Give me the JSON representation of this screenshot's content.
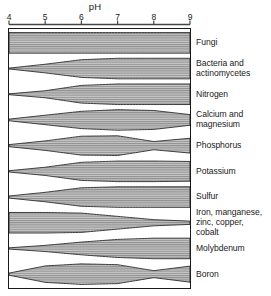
{
  "chart_data": {
    "type": "area",
    "xlabel": "pH",
    "ylabel": "",
    "xlim": [
      4,
      9
    ],
    "xticks": [
      4,
      5,
      6,
      7,
      8,
      9
    ],
    "xtick_labels": [
      "4",
      "5",
      "6",
      "7",
      "8",
      "9"
    ],
    "grid": false,
    "legend_position": "right",
    "note": "Band thickness at each pH indicates relative availability / activity. Values below are band half-widths in chart units (0-1) sampled at pH 4,5,6,7,8,9.",
    "categories": [
      "Fungi",
      "Bacteria and actinomycetes",
      "Nitrogen",
      "Calcium and magnesium",
      "Phosphorus",
      "Potassium",
      "Sulfur",
      "Iron, manganese, zinc, copper, cobalt",
      "Molybdenum",
      "Boron"
    ],
    "series": [
      {
        "name": "Fungi",
        "x": [
          4,
          5,
          6,
          7,
          8,
          9
        ],
        "values": [
          1.0,
          1.0,
          1.0,
          1.0,
          1.0,
          1.0
        ]
      },
      {
        "name": "Bacteria and actinomycetes",
        "x": [
          4,
          5,
          6,
          7,
          8,
          9
        ],
        "values": [
          0.04,
          0.42,
          0.86,
          1.0,
          1.0,
          1.0
        ]
      },
      {
        "name": "Nitrogen",
        "x": [
          4,
          5,
          6,
          7,
          8,
          9
        ],
        "values": [
          0.04,
          0.34,
          0.86,
          1.0,
          1.0,
          1.0
        ]
      },
      {
        "name": "Calcium and magnesium",
        "x": [
          4,
          5,
          6,
          7,
          8,
          9
        ],
        "values": [
          0.08,
          0.46,
          0.84,
          1.0,
          0.92,
          0.52
        ]
      },
      {
        "name": "Phosphorus",
        "x": [
          4,
          5,
          6,
          7,
          8,
          9
        ],
        "values": [
          0.1,
          0.46,
          0.92,
          0.96,
          0.4,
          0.72
        ]
      },
      {
        "name": "Potassium",
        "x": [
          4,
          5,
          6,
          7,
          8,
          9
        ],
        "values": [
          0.06,
          0.4,
          0.88,
          1.0,
          1.0,
          0.96
        ]
      },
      {
        "name": "Sulfur",
        "x": [
          4,
          5,
          6,
          7,
          8,
          9
        ],
        "values": [
          0.1,
          0.46,
          0.9,
          1.0,
          1.0,
          1.0
        ]
      },
      {
        "name": "Iron, manganese, zinc, copper, cobalt",
        "x": [
          4,
          5,
          6,
          7,
          8,
          9
        ],
        "values": [
          1.0,
          1.0,
          0.94,
          0.62,
          0.3,
          0.16
        ]
      },
      {
        "name": "Molybdenum",
        "x": [
          4,
          5,
          6,
          7,
          8,
          9
        ],
        "values": [
          0.06,
          0.3,
          0.62,
          0.88,
          1.0,
          1.0
        ]
      },
      {
        "name": "Boron",
        "x": [
          4,
          5,
          6,
          7,
          8,
          9
        ],
        "values": [
          0.1,
          0.8,
          1.0,
          0.92,
          0.34,
          0.78
        ]
      }
    ]
  },
  "axis": {
    "title": "pH",
    "ticks": [
      {
        "label": "4",
        "value": 4
      },
      {
        "label": "5",
        "value": 5
      },
      {
        "label": "6",
        "value": 6
      },
      {
        "label": "7",
        "value": 7
      },
      {
        "label": "8",
        "value": 8
      },
      {
        "label": "9",
        "value": 9
      }
    ]
  },
  "legend": {
    "items": [
      {
        "label": "Fungi"
      },
      {
        "label": "Bacteria and\nactinomycetes"
      },
      {
        "label": "Nitrogen"
      },
      {
        "label": "Calcium and\nmagnesium"
      },
      {
        "label": "Phosphorus"
      },
      {
        "label": "Potassium"
      },
      {
        "label": "Sulfur"
      },
      {
        "label": "Iron, manganese,\nzinc, copper,\ncobalt"
      },
      {
        "label": "Molybdenum"
      },
      {
        "label": "Boron"
      }
    ]
  },
  "colors": {
    "band_fill": "#b0b0b0",
    "band_stroke": "#2b2b2b",
    "frame": "#1a1a1a",
    "axis": "#444444",
    "background": "#ffffff",
    "text": "#1a1a1a"
  }
}
